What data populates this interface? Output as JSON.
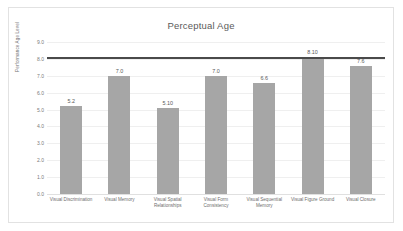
{
  "chart_data": {
    "type": "bar",
    "title": "Perceptual Age",
    "xlabel": "",
    "ylabel": "Performance Age Level",
    "categories": [
      "Visual Discrimination",
      "Visual Memory",
      "Visual Spatial Relationships",
      "Visual Form Consistency",
      "Visual Sequential Memory",
      "Visual Figure Ground",
      "Visual Closure"
    ],
    "values": [
      5.2,
      7.0,
      5.1,
      7.0,
      6.6,
      8.1,
      7.6
    ],
    "value_labels": [
      "5.2",
      "7.0",
      "5.10",
      "7.0",
      "6.6",
      "8.10",
      "7.6"
    ],
    "ylim": [
      0,
      9
    ],
    "ytick_labels": [
      "9.0",
      "8.0",
      "7.0",
      "6.0",
      "5.0",
      "4.0",
      "3.0",
      "2.0",
      "1.0",
      "0.0"
    ],
    "ytick_values": [
      9,
      8,
      7,
      6,
      5,
      4,
      3,
      2,
      1,
      0
    ],
    "grid": true,
    "legend": false,
    "reference_line": {
      "value": 8.1,
      "color": "#4a4a4a"
    },
    "bar_color": "#a6a6a6",
    "gridline_color": "#efefef",
    "frame_color": "#e2e2e2"
  }
}
